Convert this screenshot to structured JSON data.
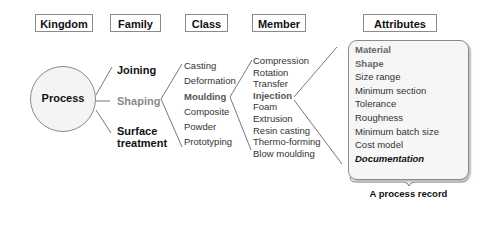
{
  "headers": {
    "kingdom": "Kingdom",
    "family": "Family",
    "class": "Class",
    "member": "Member",
    "attributes": "Attributes"
  },
  "kingdom": {
    "label": "Process"
  },
  "families": [
    {
      "label": "Joining",
      "emphasis": "bold"
    },
    {
      "label": "Shaping",
      "emphasis": "grey"
    },
    {
      "label_line1": "Surface",
      "label_line2": "treatment",
      "emphasis": "bold"
    }
  ],
  "classes": [
    "Casting",
    "Deformation",
    "Moulding",
    "Composite",
    "Powder",
    "Prototyping"
  ],
  "highlighted_class": "Moulding",
  "members": [
    "Compression",
    "Rotation",
    "Transfer",
    "Injection",
    "Foam",
    "Extrusion",
    "Resin casting",
    "Thermo-forming",
    "Blow moulding"
  ],
  "highlighted_member": "Injection",
  "attributes": [
    "Material",
    "Shape",
    "Size range",
    "Minimum section",
    "Tolerance",
    "Roughness",
    "Minimum batch size",
    "Cost model",
    "Documentation"
  ],
  "record_caption": "A process record",
  "colors": {
    "line": "#555555",
    "box_border": "#8a8a8a",
    "record_bg": "#f6f6f6"
  }
}
